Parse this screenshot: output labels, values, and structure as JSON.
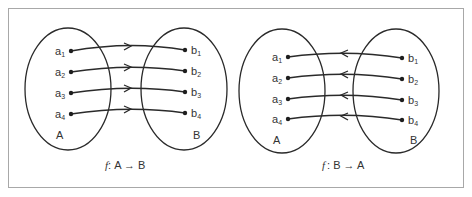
{
  "figure": {
    "frame_color": "#a8a8a8",
    "stroke_color": "#2a2a2a",
    "text_color": "#333333"
  },
  "panels": [
    {
      "id": "f-A-to-B",
      "direction": "A_to_B",
      "caption": {
        "f": "f",
        "sep": ":",
        "text": "A → B"
      },
      "set_left": {
        "name": "A",
        "elements": [
          {
            "base": "a",
            "sub": "1"
          },
          {
            "base": "a",
            "sub": "2"
          },
          {
            "base": "a",
            "sub": "3"
          },
          {
            "base": "a",
            "sub": "4"
          }
        ]
      },
      "set_right": {
        "name": "B",
        "elements": [
          {
            "base": "b",
            "sub": "1"
          },
          {
            "base": "b",
            "sub": "2"
          },
          {
            "base": "b",
            "sub": "3"
          },
          {
            "base": "b",
            "sub": "4"
          }
        ]
      },
      "mappings": [
        [
          "a1",
          "b1"
        ],
        [
          "a2",
          "b2"
        ],
        [
          "a3",
          "b3"
        ],
        [
          "a4",
          "b4"
        ]
      ]
    },
    {
      "id": "f-B-to-A",
      "direction": "B_to_A",
      "caption": {
        "f": "f",
        "sep": ":",
        "text": "B → A"
      },
      "set_left": {
        "name": "A",
        "elements": [
          {
            "base": "a",
            "sub": "1"
          },
          {
            "base": "a",
            "sub": "2"
          },
          {
            "base": "a",
            "sub": "3"
          },
          {
            "base": "a",
            "sub": "4"
          }
        ]
      },
      "set_right": {
        "name": "B",
        "elements": [
          {
            "base": "b",
            "sub": "1"
          },
          {
            "base": "b",
            "sub": "2"
          },
          {
            "base": "b",
            "sub": "3"
          },
          {
            "base": "b",
            "sub": "4"
          }
        ]
      },
      "mappings": [
        [
          "b1",
          "a1"
        ],
        [
          "b2",
          "a2"
        ],
        [
          "b3",
          "a3"
        ],
        [
          "b4",
          "a4"
        ]
      ]
    }
  ]
}
